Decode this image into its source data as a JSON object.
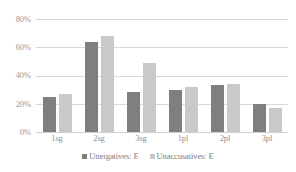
{
  "chart_data": {
    "type": "bar",
    "title": "",
    "xlabel": "",
    "ylabel": "",
    "categories": [
      "1sg",
      "2sg",
      "3sg",
      "1pl",
      "2pl",
      "3pl"
    ],
    "series": [
      {
        "name": "Unergatives: E",
        "color": "#7f7f7f",
        "values": [
          25,
          64,
          28,
          30,
          33,
          19.5
        ]
      },
      {
        "name": "Unaccusatives: E",
        "color": "#c9c9c9",
        "values": [
          27,
          68,
          49,
          32,
          34,
          17
        ]
      }
    ],
    "ylim": [
      0,
      80
    ],
    "yticks": [
      "0%",
      "20%",
      "40%",
      "60%",
      "80%"
    ],
    "ytick_values": [
      0,
      20,
      40,
      60,
      80
    ],
    "grid": true,
    "legend_position": "bottom"
  }
}
